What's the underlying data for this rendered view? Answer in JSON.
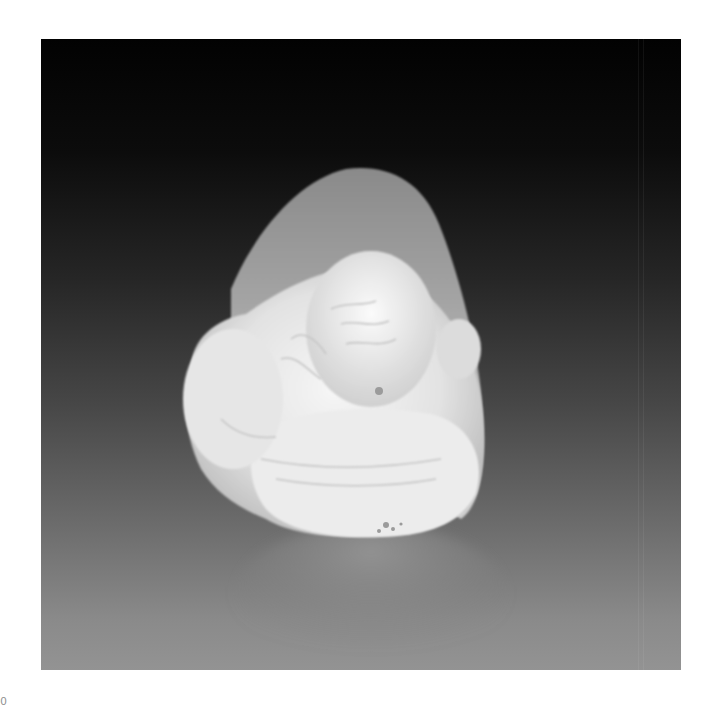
{
  "image": {
    "subject": "carved pale jade figure on dark gradient background",
    "alt": "White jade carving of a reclining figure with reflection",
    "background_top_color": "#020202",
    "background_bottom_color": "#939393",
    "jade_color": "#e9e9e9"
  },
  "caption": {
    "text": "00"
  }
}
